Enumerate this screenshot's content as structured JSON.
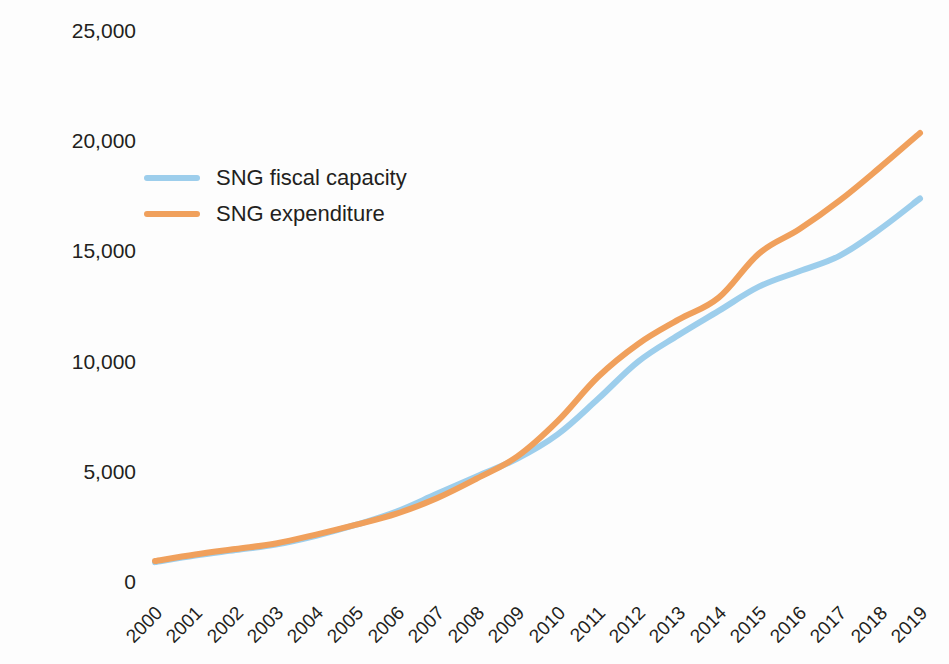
{
  "chart_data": {
    "type": "line",
    "title": "",
    "xlabel": "",
    "ylabel": "RMB billion",
    "x": [
      "2000",
      "2001",
      "2002",
      "2003",
      "2004",
      "2005",
      "2006",
      "2007",
      "2008",
      "2009",
      "2010",
      "2011",
      "2012",
      "2013",
      "2014",
      "2015",
      "2016",
      "2017",
      "2018",
      "2019"
    ],
    "categories": [
      "2000",
      "2001",
      "2002",
      "2003",
      "2004",
      "2005",
      "2006",
      "2007",
      "2008",
      "2009",
      "2010",
      "2011",
      "2012",
      "2013",
      "2014",
      "2015",
      "2016",
      "2017",
      "2018",
      "2019"
    ],
    "series": [
      {
        "name": "SNG fiscal capacity",
        "color": "#9DCEEC",
        "values": [
          900,
          1200,
          1450,
          1700,
          2100,
          2600,
          3200,
          4000,
          4800,
          5600,
          6700,
          8300,
          10000,
          11200,
          12300,
          13400,
          14100,
          14800,
          16000,
          17400
        ]
      },
      {
        "name": "SNG expenditure",
        "color": "#F0A05C",
        "values": [
          950,
          1250,
          1500,
          1750,
          2150,
          2600,
          3100,
          3800,
          4700,
          5700,
          7300,
          9300,
          10800,
          11900,
          12900,
          14900,
          16000,
          17300,
          18800,
          20370
        ]
      }
    ],
    "ylim": [
      0,
      25000
    ],
    "y_ticks": [
      "0",
      "5,000",
      "10,000",
      "15,000",
      "20,000",
      "25,000"
    ],
    "y_tick_values": [
      0,
      5000,
      10000,
      15000,
      20000,
      25000
    ],
    "grid": false,
    "legend_position": "upper-left-inside"
  },
  "legend": {
    "items": [
      {
        "label": "SNG fiscal capacity",
        "color": "#9DCEEC"
      },
      {
        "label": "SNG expenditure",
        "color": "#F0A05C"
      }
    ]
  },
  "axes": {
    "y_title": "RMB billion"
  }
}
